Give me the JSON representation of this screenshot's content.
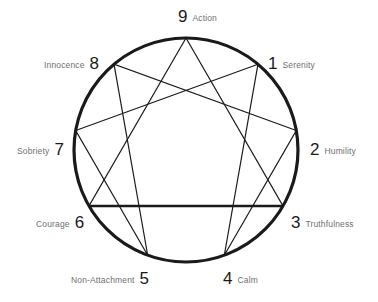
{
  "diagram": {
    "type": "enneagram",
    "background_color": "#ffffff",
    "line_color": "#1a1a1a",
    "numeral_color": "#1a1a1a",
    "word_color": "#6f6f6f",
    "circle": {
      "cx": 186,
      "cy": 150,
      "r": 112
    },
    "points": [
      {
        "number": "9",
        "word": "Action",
        "angle_deg": 0,
        "label_side": "top",
        "label_x": 178,
        "label_y": 8,
        "reversed": false
      },
      {
        "number": "1",
        "word": "Serenity",
        "angle_deg": 40,
        "label_side": "right",
        "label_x": 268,
        "label_y": 55,
        "reversed": false
      },
      {
        "number": "2",
        "word": "Humility",
        "angle_deg": 80,
        "label_side": "right",
        "label_x": 310,
        "label_y": 141,
        "reversed": false
      },
      {
        "number": "3",
        "word": "Truthfulness",
        "angle_deg": 120,
        "label_side": "right",
        "label_x": 291,
        "label_y": 214,
        "reversed": false
      },
      {
        "number": "4",
        "word": "Calm",
        "angle_deg": 160,
        "label_side": "bottom",
        "label_x": 223,
        "label_y": 270,
        "reversed": false
      },
      {
        "number": "5",
        "word": "Non-Attachment",
        "angle_deg": 200,
        "label_side": "bottom",
        "label_x": 71,
        "label_y": 270,
        "reversed": true
      },
      {
        "number": "6",
        "word": "Courage",
        "angle_deg": 240,
        "label_side": "left",
        "label_x": 36,
        "label_y": 214,
        "reversed": true
      },
      {
        "number": "7",
        "word": "Sobriety",
        "angle_deg": 280,
        "label_side": "left",
        "label_x": 17,
        "label_y": 141,
        "reversed": true
      },
      {
        "number": "8",
        "word": "Innocence",
        "angle_deg": 320,
        "label_side": "left",
        "label_x": 44,
        "label_y": 55,
        "reversed": true
      }
    ],
    "triangle_path": [
      "9",
      "3",
      "6",
      "9"
    ],
    "hexad_path": [
      "1",
      "4",
      "2",
      "8",
      "5",
      "7",
      "1"
    ],
    "emphasized_chord": [
      "6",
      "3"
    ]
  }
}
